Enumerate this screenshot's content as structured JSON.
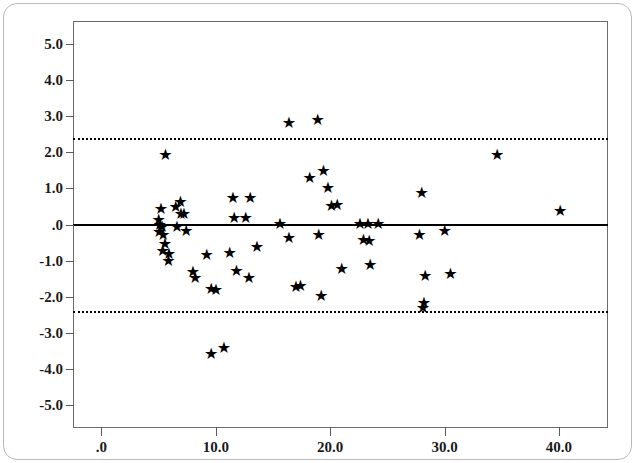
{
  "chart_data": {
    "type": "scatter",
    "title": "",
    "subtitle": "",
    "xlabel": "",
    "ylabel": "",
    "xlim": [
      -2.4,
      44.2
    ],
    "ylim": [
      -5.6,
      5.6
    ],
    "grid": false,
    "legend": null,
    "marker": "star",
    "marker_color": "#000000",
    "x_ticks": [
      0,
      10,
      20,
      30,
      40
    ],
    "x_tick_labels": [
      ".0",
      "10.0",
      "20.0",
      "30.0",
      "40.0"
    ],
    "y_ticks": [
      5,
      4,
      3,
      2,
      1,
      0,
      -1,
      -2,
      -3,
      -4,
      -5
    ],
    "y_tick_labels": [
      "5.0",
      "4.0",
      "3.0",
      "2.0",
      "1.0",
      ".0",
      "-1.0",
      "-2.0",
      "-3.0",
      "-4.0",
      "-5.0"
    ],
    "reference_lines": [
      {
        "name": "upper-limit-of-agreement",
        "y": 2.38,
        "style": "dotted",
        "width": 2,
        "color": "#000000"
      },
      {
        "name": "mean-difference",
        "y": 0.02,
        "style": "solid",
        "width": 2,
        "color": "#000000"
      },
      {
        "name": "lower-limit-of-agreement",
        "y": -2.38,
        "style": "dotted",
        "width": 2,
        "color": "#000000"
      }
    ],
    "points": [
      {
        "x": 5.2,
        "y": 0.42
      },
      {
        "x": 5.0,
        "y": 0.12
      },
      {
        "x": 5.1,
        "y": -0.02
      },
      {
        "x": 5.3,
        "y": -0.08
      },
      {
        "x": 5.05,
        "y": -0.22
      },
      {
        "x": 5.4,
        "y": -0.3
      },
      {
        "x": 5.55,
        "y": -0.55
      },
      {
        "x": 5.35,
        "y": -0.72
      },
      {
        "x": 5.9,
        "y": -0.82
      },
      {
        "x": 5.85,
        "y": -1.02
      },
      {
        "x": 5.6,
        "y": 1.92
      },
      {
        "x": 6.5,
        "y": 0.48
      },
      {
        "x": 6.9,
        "y": 0.62
      },
      {
        "x": 6.95,
        "y": 0.3
      },
      {
        "x": 7.2,
        "y": 0.28
      },
      {
        "x": 6.6,
        "y": -0.08
      },
      {
        "x": 7.4,
        "y": -0.18
      },
      {
        "x": 8.0,
        "y": -1.3
      },
      {
        "x": 8.2,
        "y": -1.48
      },
      {
        "x": 9.2,
        "y": -0.85
      },
      {
        "x": 9.6,
        "y": -1.78
      },
      {
        "x": 10.0,
        "y": -1.8
      },
      {
        "x": 9.6,
        "y": -3.58
      },
      {
        "x": 10.7,
        "y": -3.42
      },
      {
        "x": 11.5,
        "y": 0.72
      },
      {
        "x": 11.6,
        "y": 0.18
      },
      {
        "x": 11.2,
        "y": -0.78
      },
      {
        "x": 11.8,
        "y": -1.28
      },
      {
        "x": 12.6,
        "y": 0.18
      },
      {
        "x": 12.9,
        "y": -1.48
      },
      {
        "x": 13.0,
        "y": 0.72
      },
      {
        "x": 13.6,
        "y": -0.62
      },
      {
        "x": 16.4,
        "y": 2.82
      },
      {
        "x": 15.6,
        "y": 0.02
      },
      {
        "x": 16.4,
        "y": -0.38
      },
      {
        "x": 17.0,
        "y": -1.72
      },
      {
        "x": 17.4,
        "y": -1.7
      },
      {
        "x": 18.2,
        "y": 1.28
      },
      {
        "x": 18.9,
        "y": 2.88
      },
      {
        "x": 19.4,
        "y": 1.48
      },
      {
        "x": 19.8,
        "y": 1.02
      },
      {
        "x": 20.1,
        "y": 0.52
      },
      {
        "x": 20.6,
        "y": 0.55
      },
      {
        "x": 19.0,
        "y": -0.28
      },
      {
        "x": 19.2,
        "y": -1.98
      },
      {
        "x": 21.0,
        "y": -1.22
      },
      {
        "x": 22.6,
        "y": 0.02
      },
      {
        "x": 23.3,
        "y": 0.02
      },
      {
        "x": 24.2,
        "y": 0.02
      },
      {
        "x": 22.9,
        "y": -0.42
      },
      {
        "x": 23.4,
        "y": -0.45
      },
      {
        "x": 23.5,
        "y": -1.12
      },
      {
        "x": 28.0,
        "y": 0.88
      },
      {
        "x": 27.8,
        "y": -0.28
      },
      {
        "x": 28.3,
        "y": -1.42
      },
      {
        "x": 28.2,
        "y": -2.18
      },
      {
        "x": 28.1,
        "y": -2.32
      },
      {
        "x": 30.0,
        "y": -0.18
      },
      {
        "x": 30.5,
        "y": -1.38
      },
      {
        "x": 34.6,
        "y": 1.92
      },
      {
        "x": 40.1,
        "y": 0.38
      }
    ]
  },
  "axes": {
    "marker_glyph": "★",
    "frame_name": "plot-frame"
  }
}
